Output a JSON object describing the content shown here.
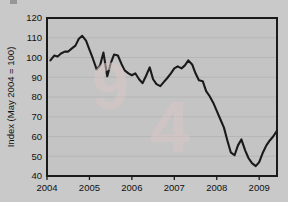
{
  "chart_data": {
    "type": "line",
    "title": "",
    "xlabel": "",
    "ylabel": "Index (May 2004 = 100)",
    "xlim": [
      2004.0,
      2009.42
    ],
    "ylim": [
      40,
      120
    ],
    "yticks": [
      40,
      50,
      60,
      70,
      80,
      90,
      100,
      110,
      120
    ],
    "xticks": [
      2004,
      2005,
      2006,
      2007,
      2008,
      2009
    ],
    "xtick_labels": [
      "2004",
      "2005",
      "2006",
      "2007",
      "2008",
      "2009"
    ],
    "ytick_labels": [
      "40",
      "50",
      "60",
      "70",
      "80",
      "90",
      "100",
      "110",
      "120"
    ],
    "grid": true,
    "legend": "none",
    "series": [
      {
        "name": "Index",
        "color": "#1a1a1a",
        "x": [
          2004.08,
          2004.17,
          2004.25,
          2004.33,
          2004.42,
          2004.5,
          2004.58,
          2004.67,
          2004.75,
          2004.83,
          2004.92,
          2005.0,
          2005.08,
          2005.17,
          2005.25,
          2005.33,
          2005.42,
          2005.5,
          2005.58,
          2005.67,
          2005.75,
          2005.83,
          2005.92,
          2006.0,
          2006.08,
          2006.17,
          2006.25,
          2006.33,
          2006.42,
          2006.5,
          2006.58,
          2006.67,
          2006.75,
          2006.83,
          2006.92,
          2007.0,
          2007.08,
          2007.17,
          2007.25,
          2007.33,
          2007.42,
          2007.5,
          2007.58,
          2007.67,
          2007.75,
          2007.83,
          2007.92,
          2008.0,
          2008.08,
          2008.17,
          2008.25,
          2008.33,
          2008.42,
          2008.5,
          2008.58,
          2008.67,
          2008.75,
          2008.83,
          2008.92,
          2009.0,
          2009.08,
          2009.17,
          2009.25,
          2009.33,
          2009.42
        ],
        "y": [
          98.5,
          101.0,
          100.5,
          102.0,
          103.0,
          103.0,
          104.5,
          106.0,
          109.5,
          111.0,
          108.5,
          104.0,
          99.5,
          94.0,
          96.0,
          102.5,
          90.5,
          97.0,
          101.5,
          101.0,
          97.0,
          93.5,
          92.0,
          91.0,
          92.0,
          89.0,
          87.0,
          90.5,
          95.0,
          89.0,
          86.5,
          85.5,
          87.5,
          89.5,
          92.0,
          94.5,
          95.5,
          94.5,
          96.0,
          98.5,
          96.5,
          92.0,
          88.5,
          88.0,
          83.0,
          80.5,
          77.0,
          73.0,
          69.0,
          64.5,
          58.0,
          52.0,
          50.5,
          55.5,
          58.5,
          53.0,
          49.0,
          46.5,
          45.0,
          47.0,
          51.5,
          55.5,
          58.0,
          60.0,
          63.0
        ]
      }
    ]
  },
  "figure": {
    "plot_bg": "#c4c4c4",
    "frame_color": "#1a1a1a",
    "grid_color": "#b4b4b4",
    "watermark_left": "9",
    "watermark_right": "4"
  }
}
